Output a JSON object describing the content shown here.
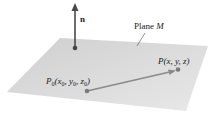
{
  "diagram": {
    "plane_label": "Plane M",
    "plane_label_text": "Plane ",
    "plane_label_var": "M",
    "normal_label": "n",
    "point_p0": {
      "label": "P0(x0, y0, z0)",
      "P": "P",
      "sub0": "0",
      "x": "x",
      "y": "y",
      "z": "z"
    },
    "point_p": {
      "label": "P(x, y, z)"
    },
    "colors": {
      "plane": "#d9d9d9",
      "normal_vector": "#555555",
      "vector": "#8a8a8a",
      "point": "#7a7a7a"
    }
  }
}
